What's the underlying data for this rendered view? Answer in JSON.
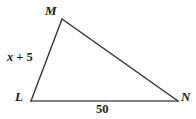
{
  "figure": {
    "name": "triangle-lmn",
    "type": "geometry-diagram",
    "background_color": "#ffffff",
    "width": 196,
    "height": 119,
    "vertices": [
      {
        "id": "M",
        "label": "M",
        "x": 62,
        "y": 19
      },
      {
        "id": "L",
        "label": "L",
        "x": 31,
        "y": 101
      },
      {
        "id": "N",
        "label": "N",
        "x": 178,
        "y": 101
      }
    ],
    "sides": [
      {
        "id": "LM",
        "from": "L",
        "to": "M",
        "label": "x + 5",
        "label_variable": "x",
        "label_operator": "+",
        "label_constant": "5",
        "stroke_color": "#2b2b2b",
        "stroke_width": 1.3
      },
      {
        "id": "MN",
        "from": "M",
        "to": "N",
        "label": "",
        "stroke_color": "#2b2b2b",
        "stroke_width": 1.3
      },
      {
        "id": "LN",
        "from": "L",
        "to": "N",
        "label": "50",
        "stroke_color": "#808080",
        "stroke_width": 2.1
      }
    ],
    "labels": {
      "vertex_m": "M",
      "vertex_l": "L",
      "vertex_n": "N",
      "side_lm_variable": "x",
      "side_lm_operator": "+",
      "side_lm_constant": "5",
      "side_ln": "50"
    }
  }
}
